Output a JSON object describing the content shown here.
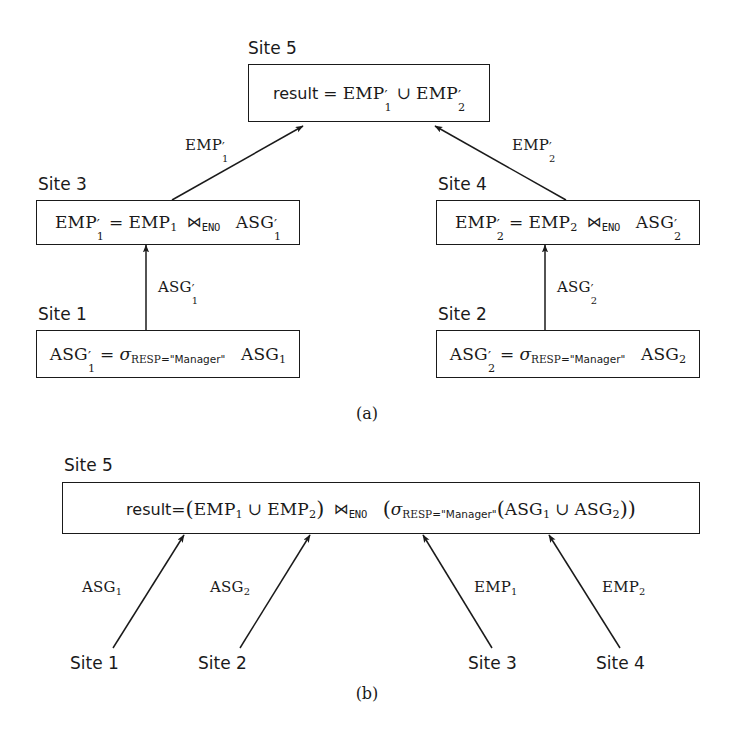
{
  "figure": {
    "part_a": {
      "caption": "(a)",
      "nodes": [
        {
          "id": "a-site5",
          "site_label": "Site 5",
          "expression_text": "result = EMP'_1 ∪ EMP'_2",
          "lhs": "result",
          "equals": "=",
          "operands": [
            "EMP",
            "EMP"
          ],
          "subscripts": [
            "1",
            "2"
          ],
          "operator": "∪"
        },
        {
          "id": "a-site3",
          "site_label": "Site 3",
          "expression_text": "EMP'_1 = EMP_1 ⋈_ENO ASG'_1",
          "lhs": "EMP",
          "lhs_sub": "1",
          "equals": "=",
          "left_operand": "EMP",
          "left_sub": "1",
          "join_symbol": "⋈",
          "join_attribute": "ENO",
          "right_operand": "ASG",
          "right_sub": "1"
        },
        {
          "id": "a-site4",
          "site_label": "Site 4",
          "expression_text": "EMP'_2 = EMP_2 ⋈_ENO ASG'_2",
          "lhs": "EMP",
          "lhs_sub": "2",
          "equals": "=",
          "left_operand": "EMP",
          "left_sub": "2",
          "join_symbol": "⋈",
          "join_attribute": "ENO",
          "right_operand": "ASG",
          "right_sub": "2"
        },
        {
          "id": "a-site1",
          "site_label": "Site 1",
          "expression_text": "ASG'_1 = σ_RESP=\"Manager\" ASG_1",
          "lhs": "ASG",
          "lhs_sub": "1",
          "equals": "=",
          "sigma": "σ",
          "predicate_attribute": "RESP",
          "predicate_equals": "=",
          "predicate_value": "\"Manager\"",
          "operand": "ASG",
          "operand_sub": "1"
        },
        {
          "id": "a-site2",
          "site_label": "Site 2",
          "expression_text": "ASG'_2 = σ_RESP=\"Manager\" ASG_2",
          "lhs": "ASG",
          "lhs_sub": "2",
          "equals": "=",
          "sigma": "σ",
          "predicate_attribute": "RESP",
          "predicate_equals": "=",
          "predicate_value": "\"Manager\"",
          "operand": "ASG",
          "operand_sub": "2"
        }
      ],
      "edges": [
        {
          "id": "edge-emp1",
          "label_base": "EMP",
          "label_sub": "1",
          "primed": true,
          "from": "a-site3",
          "to": "a-site5"
        },
        {
          "id": "edge-emp2",
          "label_base": "EMP",
          "label_sub": "2",
          "primed": true,
          "from": "a-site4",
          "to": "a-site5"
        },
        {
          "id": "edge-asg1",
          "label_base": "ASG",
          "label_sub": "1",
          "primed": true,
          "from": "a-site1",
          "to": "a-site3"
        },
        {
          "id": "edge-asg2",
          "label_base": "ASG",
          "label_sub": "2",
          "primed": true,
          "from": "a-site2",
          "to": "a-site4"
        }
      ]
    },
    "part_b": {
      "caption": "(b)",
      "node": {
        "id": "b-site5",
        "site_label": "Site 5",
        "expression_text": "result=(EMP_1 ∪ EMP_2) ⋈_ENO (σ_RESP=\"Manager\"(ASG_1 ∪ ASG_2))",
        "lhs": "result",
        "equals": "=",
        "union_symbol": "∪",
        "join_symbol": "⋈",
        "join_attribute": "ENO",
        "sigma": "σ",
        "predicate_attribute": "RESP",
        "predicate_equals": "=",
        "predicate_value": "\"Manager\"",
        "emp": "EMP",
        "asg": "ASG",
        "sub1": "1",
        "sub2": "2"
      },
      "sources": [
        {
          "id": "b-src-1",
          "site_label": "Site 1",
          "edge_base": "ASG",
          "edge_sub": "1"
        },
        {
          "id": "b-src-2",
          "site_label": "Site 2",
          "edge_base": "ASG",
          "edge_sub": "2"
        },
        {
          "id": "b-src-3",
          "site_label": "Site 3",
          "edge_base": "EMP",
          "edge_sub": "1"
        },
        {
          "id": "b-src-4",
          "site_label": "Site 4",
          "edge_base": "EMP",
          "edge_sub": "2"
        }
      ]
    }
  },
  "style": {
    "line_color": "#1a1a1a",
    "background": "#ffffff"
  }
}
